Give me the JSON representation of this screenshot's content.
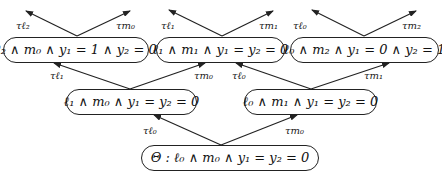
{
  "nodes": {
    "top_left": "ℓ₂ ∧ m₀ ∧ y₁ = 1 ∧ y₂ = 0",
    "top_middle": "ℓ₁ ∧ m₁ ∧ y₁ = y₂ = 0",
    "top_right": "ℓ₀ ∧ m₂ ∧ y₁ = 0 ∧ y₂ = 1",
    "mid_left": "ℓ₁ ∧ m₀ ∧ y₁ = y₂ = 0",
    "mid_right": "ℓ₀ ∧ m₁ ∧ y₁ = y₂ = 0",
    "root": "Θ : ℓ₀ ∧ m₀ ∧ y₁ = y₂ = 0"
  },
  "edges": {
    "top_left_l": "τℓ₂",
    "top_left_m": "τm₀",
    "top_middle_l": "τℓ₁",
    "top_middle_m": "τm₁",
    "top_right_l": "τℓ₀",
    "top_right_m": "τm₂",
    "mid_left_l": "τℓ₁",
    "mid_left_m": "τm₀",
    "mid_right_l": "τℓ₀",
    "mid_right_m": "τm₁",
    "root_l": "τℓ₀",
    "root_m": "τm₀"
  },
  "colors": {
    "stroke": "#222222",
    "background": "#ffffff"
  }
}
